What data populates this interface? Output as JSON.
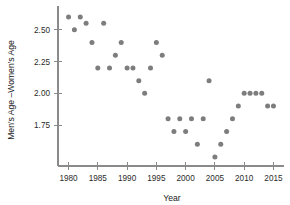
{
  "chart_data": {
    "type": "scatter",
    "title": "",
    "xlabel": "Year",
    "ylabel": "Men's Age –Women's Age",
    "xlim": [
      1978.2,
      2016.8
    ],
    "ylim": [
      1.43,
      2.67
    ],
    "grid": false,
    "legend": null,
    "point_color": "#7d7d7d",
    "axis_color": "#8a8a8a",
    "xticks": [
      1980,
      1985,
      1990,
      1995,
      2000,
      2005,
      2010,
      2015
    ],
    "xtick_labels": [
      "1980",
      "1985",
      "1990",
      "1995",
      "2000",
      "2005",
      "2010",
      "2015"
    ],
    "yticks": [
      1.75,
      2.0,
      2.25,
      2.5
    ],
    "ytick_labels": [
      "1.75",
      "2.00",
      "2.25",
      "2.50"
    ],
    "x": [
      1980,
      1981,
      1982,
      1983,
      1984,
      1985,
      1986,
      1987,
      1988,
      1989,
      1990,
      1991,
      1992,
      1993,
      1994,
      1995,
      1996,
      1997,
      1998,
      1999,
      2000,
      2001,
      2002,
      2003,
      2004,
      2005,
      2006,
      2007,
      2008,
      2009,
      2010,
      2011,
      2012,
      2013,
      2014,
      2015
    ],
    "y": [
      2.6,
      2.5,
      2.6,
      2.55,
      2.4,
      2.2,
      2.55,
      2.2,
      2.3,
      2.4,
      2.2,
      2.2,
      2.1,
      2.0,
      2.2,
      2.4,
      2.3,
      1.8,
      1.7,
      1.8,
      1.7,
      1.8,
      1.6,
      1.8,
      2.1,
      1.5,
      1.6,
      1.7,
      1.8,
      1.9,
      2.0,
      2.0,
      2.0,
      2.0,
      1.9,
      1.9
    ],
    "points": [
      {
        "year": 1980,
        "value": 2.6
      },
      {
        "year": 1981,
        "value": 2.5
      },
      {
        "year": 1982,
        "value": 2.6
      },
      {
        "year": 1983,
        "value": 2.55
      },
      {
        "year": 1984,
        "value": 2.4
      },
      {
        "year": 1985,
        "value": 2.2
      },
      {
        "year": 1986,
        "value": 2.55
      },
      {
        "year": 1987,
        "value": 2.2
      },
      {
        "year": 1988,
        "value": 2.3
      },
      {
        "year": 1989,
        "value": 2.4
      },
      {
        "year": 1990,
        "value": 2.2
      },
      {
        "year": 1991,
        "value": 2.2
      },
      {
        "year": 1992,
        "value": 2.1
      },
      {
        "year": 1993,
        "value": 2.0
      },
      {
        "year": 1994,
        "value": 2.2
      },
      {
        "year": 1995,
        "value": 2.4
      },
      {
        "year": 1996,
        "value": 2.3
      },
      {
        "year": 1997,
        "value": 1.8
      },
      {
        "year": 1998,
        "value": 1.7
      },
      {
        "year": 1999,
        "value": 1.8
      },
      {
        "year": 2000,
        "value": 1.7
      },
      {
        "year": 2001,
        "value": 1.8
      },
      {
        "year": 2002,
        "value": 1.6
      },
      {
        "year": 2003,
        "value": 1.8
      },
      {
        "year": 2004,
        "value": 2.1
      },
      {
        "year": 2005,
        "value": 1.5
      },
      {
        "year": 2006,
        "value": 1.6
      },
      {
        "year": 2007,
        "value": 1.7
      },
      {
        "year": 2008,
        "value": 1.8
      },
      {
        "year": 2009,
        "value": 1.9
      },
      {
        "year": 2010,
        "value": 2.0
      },
      {
        "year": 2011,
        "value": 2.0
      },
      {
        "year": 2012,
        "value": 2.0
      },
      {
        "year": 2013,
        "value": 2.0
      },
      {
        "year": 2014,
        "value": 1.9
      },
      {
        "year": 2015,
        "value": 1.9
      }
    ]
  }
}
